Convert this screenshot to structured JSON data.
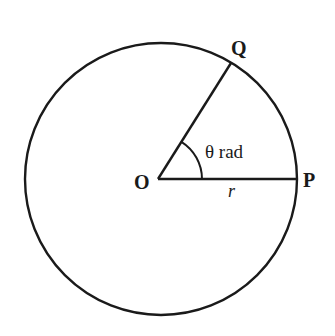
{
  "diagram": {
    "colors": {
      "stroke": "#1a1a1a",
      "background": "#ffffff"
    },
    "labels": {
      "center": "O",
      "point_p": "P",
      "point_q": "Q",
      "angle": "θ rad",
      "radius": "r"
    },
    "geometry": {
      "center": [
        158,
        179
      ],
      "radius": 137,
      "p": [
        295,
        179
      ],
      "q": [
        231,
        62
      ],
      "angle_arc_radius": 44
    }
  }
}
